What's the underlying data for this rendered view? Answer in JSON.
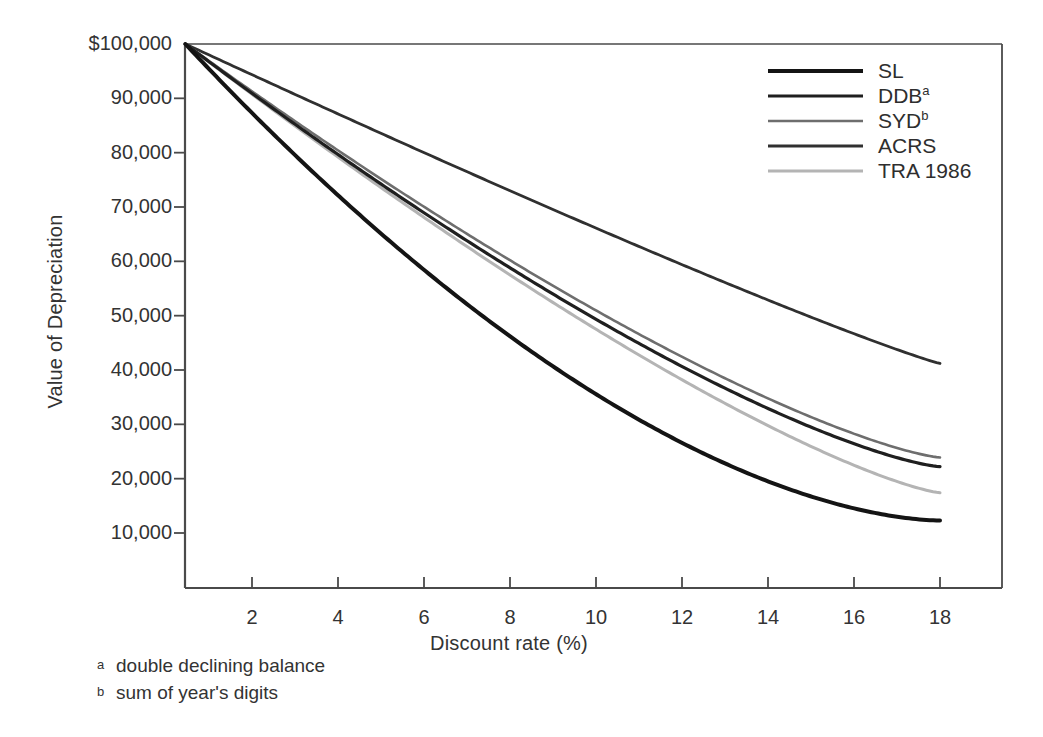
{
  "chart_data": {
    "type": "line",
    "title": "",
    "xlabel": "Discount rate (%)",
    "ylabel": "Value of Depreciation",
    "xlim": [
      0.45,
      18.0
    ],
    "ylim": [
      0,
      100000
    ],
    "grid": false,
    "legend_position": "top-right",
    "xticks": [
      2,
      4,
      6,
      8,
      10,
      12,
      14,
      16,
      18
    ],
    "xtick_labels": [
      "2",
      "4",
      "6",
      "8",
      "10",
      "12",
      "14",
      "16",
      "18"
    ],
    "yticks": [
      10000,
      20000,
      30000,
      40000,
      50000,
      60000,
      70000,
      80000,
      90000,
      100000
    ],
    "ytick_labels": [
      "10,000",
      "20,000",
      "30,000",
      "40,000",
      "50,000",
      "60,000",
      "70,000",
      "80,000",
      "90,000",
      "$100,000"
    ],
    "x": [
      0.45,
      2,
      4,
      6,
      8,
      10,
      12,
      14,
      16,
      18
    ],
    "series": [
      {
        "name": "SL",
        "label": "SL",
        "color": "#141414",
        "width": 4.0,
        "values": [
          100000,
          81500,
          66200,
          54800,
          46200,
          39700,
          34600,
          30500,
          27200,
          24500
        ]
      },
      {
        "name": "DDB",
        "label": "DDB",
        "superscript": "a",
        "color": "#1f1f1f",
        "width": 3.2,
        "values": [
          100000,
          86200,
          74700,
          65800,
          58800,
          53200,
          48700,
          45000,
          41900,
          39300
        ]
      },
      {
        "name": "SYD",
        "label": "SYD",
        "superscript": "b",
        "color": "#6e6e6e",
        "width": 2.6,
        "values": [
          100000,
          86800,
          75900,
          67200,
          60200,
          54500,
          49800,
          45900,
          42600,
          39800
        ]
      },
      {
        "name": "ACRS",
        "label": "ACRS",
        "superscript": "",
        "color": "#303030",
        "width": 2.8,
        "values": [
          100000,
          91300,
          84100,
          78100,
          73000,
          68700,
          65000,
          61800,
          59000,
          56500
        ]
      },
      {
        "name": "TRA 1986",
        "label": "TRA 1986",
        "superscript": "",
        "color": "#b4b4b4",
        "width": 3.0,
        "values": [
          100000,
          86300,
          74800,
          65300,
          57500,
          51000,
          45600,
          41000,
          37200,
          33900
        ]
      }
    ],
    "endpoint_values_at_18": {
      "SL": 12300,
      "DDB": 22200,
      "SYD": 23900,
      "ACRS": 41200,
      "TRA 1986": 17400
    },
    "footnotes": [
      {
        "marker": "a",
        "text": "double declining balance"
      },
      {
        "marker": "b",
        "text": "sum of year's digits"
      }
    ]
  },
  "axis": {
    "y_title": "Value of Depreciation",
    "x_title": "Discount rate (%)"
  },
  "colors": {
    "axis": "#4a4a4a",
    "text": "#333333",
    "background": "#ffffff"
  }
}
